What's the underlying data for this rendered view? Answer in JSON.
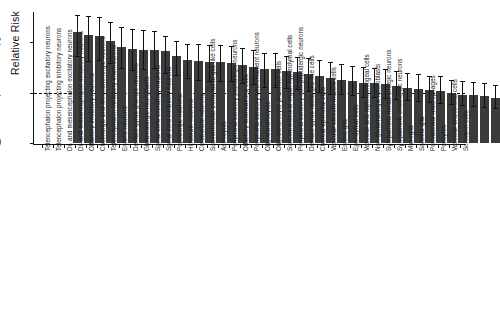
{
  "chart_data": {
    "type": "bar",
    "title": "",
    "xlabel": "",
    "ylabel": "Relative Risk",
    "ylim": [
      0,
      2.6
    ],
    "yticks": [
      0,
      1,
      2
    ],
    "ytick_labels": [
      "0",
      "1",
      "2"
    ],
    "grid": false,
    "legend": null,
    "reference_line": {
      "y": 1,
      "style": "dashed"
    },
    "error_bars": "95% confidence interval",
    "bar_color": "#3b3b3b",
    "categories": [
      "Telencephalon projecting excitatory neurons",
      "Telencephalon projecting inhibitory neurons",
      "Di- and mesencephalon excitatory neurons",
      "Di- and mesencephalon inhibitory neurons",
      "Olfactory inhibitory neurons",
      "Cholinergic and monoaminergic neurons",
      "Telencephalon inhibitory interneurons",
      "Enteric neurons",
      "Dentate gyrus granule neurons",
      "Glutamatergic neuroblasts",
      "Spinal cord excitatory neurons",
      "Spinal cord inhibitory neurons",
      "Peptidergic neurons",
      "Hindbrain neurons",
      "Cerebellum neurons",
      "Subventricular zone radial glia-like cells",
      "Astrocytes",
      "Peripheral sensory peptidergic neurons",
      "Olfactory ensheathing cells",
      "Peripheral sensory neurofilament neurons",
      "Oligodendrocytes",
      "Oligodendrocyte precursor cells",
      "Subcommissural organ hypendymal cells",
      "Peripheral sensory non-peptidergic neurons",
      "Dentate gyrus radial glia-like cells",
      "Choroid epithelial cells",
      "Vascular smooth muscle cells",
      "Enteric glia",
      "Ependymal cells",
      "Vascular and leptomeningeal cells",
      "Non-glutamatergic neuroblasts",
      "Sympathetic noradrenergic neurons",
      "Sympathetic cholinergic neurons",
      "Microglia",
      "Satellite glia",
      "Perivascular macrophages",
      "Pericytes",
      "Vascular endothelial cells",
      "Schwann cells"
    ],
    "values": [
      2.21,
      2.14,
      2.13,
      2.02,
      1.91,
      1.86,
      1.85,
      1.84,
      1.82,
      1.72,
      1.65,
      1.62,
      1.61,
      1.6,
      1.59,
      1.55,
      1.51,
      1.47,
      1.46,
      1.42,
      1.4,
      1.37,
      1.33,
      1.29,
      1.26,
      1.23,
      1.2,
      1.19,
      1.18,
      1.14,
      1.1,
      1.07,
      1.05,
      1.04,
      0.99,
      0.96,
      0.95,
      0.93,
      0.9
    ],
    "ci_lower": [
      1.72,
      1.63,
      1.64,
      1.58,
      1.49,
      1.45,
      1.46,
      1.48,
      1.39,
      1.34,
      1.3,
      1.25,
      1.24,
      1.23,
      1.23,
      1.19,
      1.17,
      1.12,
      1.12,
      1.09,
      1.07,
      1.04,
      1.01,
      0.98,
      0.97,
      0.95,
      0.92,
      0.91,
      0.9,
      0.88,
      0.85,
      0.83,
      0.81,
      0.8,
      0.77,
      0.75,
      0.74,
      0.72,
      0.7
    ],
    "ci_upper": [
      2.55,
      2.52,
      2.5,
      2.41,
      2.3,
      2.26,
      2.25,
      2.23,
      2.12,
      2.02,
      1.97,
      1.96,
      1.95,
      1.94,
      1.92,
      1.88,
      1.84,
      1.79,
      1.78,
      1.73,
      1.71,
      1.68,
      1.64,
      1.6,
      1.56,
      1.53,
      1.5,
      1.49,
      1.47,
      1.43,
      1.39,
      1.36,
      1.33,
      1.32,
      1.26,
      1.23,
      1.21,
      1.19,
      1.16
    ]
  }
}
